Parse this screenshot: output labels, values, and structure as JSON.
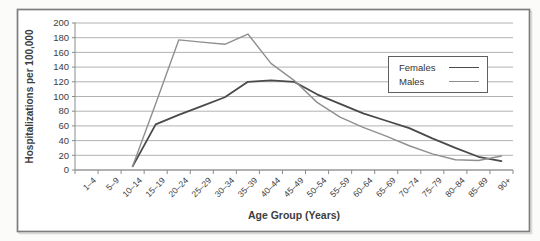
{
  "figure": {
    "background": "#fbfbfa",
    "frame_color": "#7d7d7d",
    "plot_background": "#ffffff",
    "gridline_color": "#a9a9a9",
    "axis_color": "#8a8a8a",
    "tick_label_color": "#404040"
  },
  "chart_data": {
    "type": "line",
    "title": "",
    "xlabel": "Age Group (Years)",
    "ylabel": "Hospitalizations per 100,000",
    "ylim": [
      0,
      200
    ],
    "ytick_step": 20,
    "yticks": [
      0,
      20,
      40,
      60,
      80,
      100,
      120,
      140,
      160,
      180,
      200
    ],
    "grid": "horizontal",
    "legend_position": "center-right",
    "categories": [
      "1–4",
      "5–9",
      "10–14",
      "15–19",
      "20–24",
      "25–29",
      "30–34",
      "35–39",
      "40–44",
      "45–49",
      "50–54",
      "55–59",
      "60–64",
      "65–69",
      "70–74",
      "75–79",
      "80–84",
      "85–89",
      "90+"
    ],
    "series": [
      {
        "name": "Females",
        "color": "#4a4a4a",
        "stroke_width": 1.8,
        "values": [
          null,
          null,
          5,
          62,
          75,
          87,
          99,
          120,
          122,
          120,
          103,
          90,
          77,
          67,
          57,
          43,
          30,
          18,
          12
        ]
      },
      {
        "name": "Males",
        "color": "#8f8f8f",
        "stroke_width": 1.4,
        "values": [
          null,
          null,
          5,
          90,
          177,
          174,
          171,
          185,
          145,
          122,
          92,
          72,
          58,
          46,
          33,
          22,
          14,
          13,
          19
        ]
      }
    ]
  }
}
